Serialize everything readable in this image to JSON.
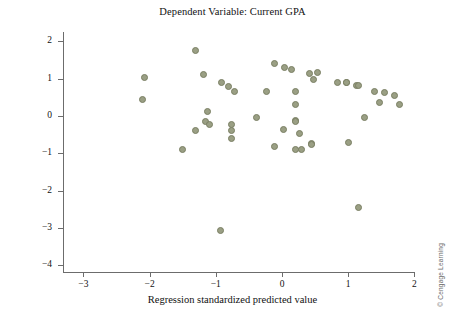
{
  "chart_data": {
    "type": "scatter",
    "title": "Dependent Variable: Current GPA",
    "xlabel": "Regression standardized predicted value",
    "ylabel": "Regression standardized residual",
    "xlim": [
      -3.3,
      2.0
    ],
    "ylim": [
      -4.35,
      2.35
    ],
    "xticks": [
      -3,
      -2,
      -1,
      0,
      1,
      2
    ],
    "xtick_labels": [
      "−3",
      "−2",
      "−1",
      "0",
      "1",
      "2"
    ],
    "yticks": [
      2,
      1,
      0,
      -1,
      -2,
      -3,
      -4
    ],
    "ytick_labels": [
      "2",
      "1",
      "0",
      "−1",
      "−2",
      "−3",
      "−4"
    ],
    "grid": false,
    "legend": false,
    "marker": {
      "shape": "circle",
      "fill_color": "#9a9f84",
      "edge_color": "#7a7f63",
      "size_px": 7
    },
    "x": [
      -1.31,
      -2.08,
      -2.1,
      -1.18,
      -0.92,
      -0.81,
      -0.72,
      -1.13,
      -1.16,
      -1.1,
      -1.3,
      -0.77,
      -0.77,
      -0.77,
      -1.51,
      -0.11,
      0.04,
      0.15,
      0.42,
      0.53,
      0.48,
      0.84,
      0.98,
      -0.23,
      0.2,
      0.21,
      -0.38,
      0.02,
      0.2,
      0.21,
      0.26,
      -0.12,
      0.21,
      0.3,
      0.45,
      0.97,
      1.12,
      1.16,
      1.4,
      1.55,
      1.7,
      1.48,
      1.78,
      1.25,
      1.0,
      0.44,
      -0.93,
      1.15
    ],
    "y": [
      1.75,
      1.02,
      0.43,
      1.1,
      0.91,
      0.78,
      0.67,
      0.13,
      -0.16,
      -0.22,
      -0.4,
      -0.22,
      -0.4,
      -0.59,
      -0.91,
      1.4,
      1.29,
      1.26,
      1.13,
      1.16,
      0.97,
      0.91,
      0.91,
      0.65,
      0.65,
      0.3,
      -0.05,
      -0.35,
      -0.11,
      -0.16,
      -0.46,
      -0.81,
      -0.89,
      -0.89,
      -0.73,
      0.89,
      0.83,
      0.83,
      0.65,
      0.62,
      0.56,
      0.35,
      0.32,
      -0.03,
      -0.7,
      -0.76,
      -3.07,
      -2.45
    ],
    "n_points": 48,
    "credit": "© Cengage Learning"
  }
}
